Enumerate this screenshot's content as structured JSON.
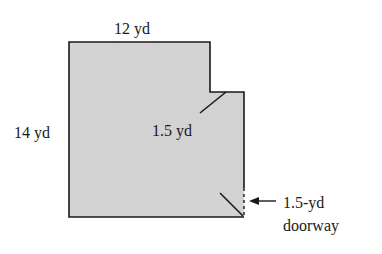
{
  "figure": {
    "labels": {
      "top": "12 yd",
      "left": "14 yd",
      "diagonal": "1.5 yd",
      "doorway_line1": "1.5-yd",
      "doorway_line2": "doorway"
    },
    "colors": {
      "fill": "#d6d6d6",
      "stroke": "#1a1a1a",
      "background": "#ffffff"
    }
  }
}
